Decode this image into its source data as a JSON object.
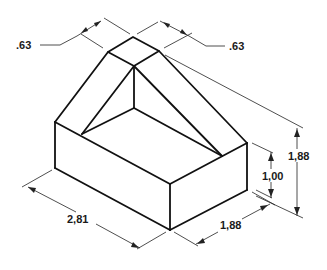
{
  "diagram": {
    "type": "isometric-technical-drawing",
    "background": "#ffffff",
    "line_color": "#111111",
    "dimensions": {
      "top_left_width": ".63",
      "top_right_width": ".63",
      "overall_height": "1,88",
      "base_height": "1,00",
      "length": "2,81",
      "depth": "1,88"
    }
  }
}
